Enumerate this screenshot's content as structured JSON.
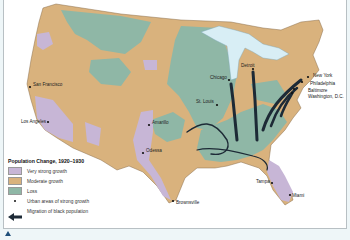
{
  "map": {
    "title": "Population Change, 1920–1930",
    "colors": {
      "very_strong_growth": "#c7b6d6",
      "moderate_growth": "#d9b27d",
      "loss": "#8fb7a6",
      "water": "#d8eef5",
      "migration_arrow": "#1d2a36",
      "background": "#ffffff"
    },
    "cities": [
      {
        "name": "San Francisco",
        "x": 29,
        "y": 87,
        "lx": 32,
        "ly": 85
      },
      {
        "name": "Los Angeles",
        "x": 47,
        "y": 122,
        "lx": 20,
        "ly": 122
      },
      {
        "name": "Amarillo",
        "x": 148,
        "y": 125,
        "lx": 151,
        "ly": 123
      },
      {
        "name": "Odessa",
        "x": 142,
        "y": 153,
        "lx": 145,
        "ly": 151
      },
      {
        "name": "Brownsville",
        "x": 172,
        "y": 201,
        "lx": 175,
        "ly": 203
      },
      {
        "name": "St. Louis",
        "x": 216,
        "y": 105,
        "lx": 195,
        "ly": 102
      },
      {
        "name": "Chicago",
        "x": 228,
        "y": 80,
        "lx": 209,
        "ly": 78
      },
      {
        "name": "Detroit",
        "x": 252,
        "y": 69,
        "lx": 240,
        "ly": 66
      },
      {
        "name": "New York",
        "x": 307,
        "y": 77,
        "lx": 312,
        "ly": 76
      },
      {
        "name": "Philadelphia",
        "x": 301,
        "y": 82,
        "lx": 309,
        "ly": 84
      },
      {
        "name": "Baltimore",
        "x": 293,
        "y": 89,
        "lx": 307,
        "ly": 91
      },
      {
        "name": "Washington, D.C.",
        "x": 291,
        "y": 93,
        "lx": 307,
        "ly": 97
      },
      {
        "name": "Tampa",
        "x": 271,
        "y": 183,
        "lx": 255,
        "ly": 182
      },
      {
        "name": "Miami",
        "x": 289,
        "y": 195,
        "lx": 291,
        "ly": 196
      }
    ]
  },
  "legend": {
    "title": "Population Change, 1920–1930",
    "items": [
      {
        "type": "swatch",
        "label": "Very strong growth",
        "color": "#c7b6d6"
      },
      {
        "type": "swatch",
        "label": "Moderate growth",
        "color": "#d9b27d"
      },
      {
        "type": "swatch",
        "label": "Loss",
        "color": "#8fb7a6"
      },
      {
        "type": "dot",
        "label": "Urban areas of strong growth"
      },
      {
        "type": "arrow",
        "label": "Migration of black population"
      }
    ]
  },
  "controls": {
    "scroll_up_icon": "triangle-up"
  }
}
